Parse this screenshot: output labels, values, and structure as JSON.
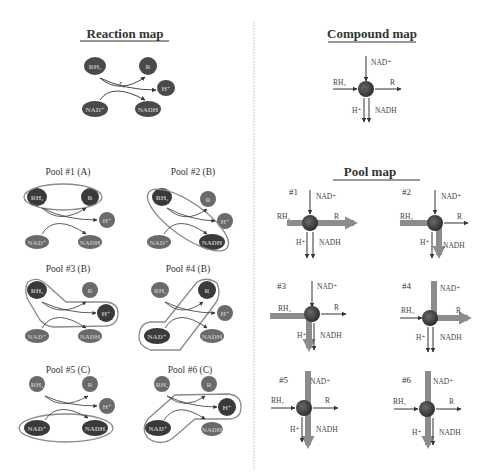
{
  "reaction_map": {
    "title": "Reaction map",
    "rate_label": "r₁",
    "nodes": {
      "rh2": "RH₂",
      "r": "R",
      "h": "H⁺",
      "nad": "NAD⁺",
      "nadh": "NADH"
    }
  },
  "compound_map": {
    "title": "Compound map",
    "center_label": "r₁",
    "labels": {
      "nad": "NAD⁺",
      "rh2": "RH₂",
      "r": "R",
      "h": "H⁺",
      "nadh": "NADH"
    }
  },
  "pools": [
    {
      "label": "Pool #1 (A)",
      "members": [
        "RH₂",
        "R"
      ]
    },
    {
      "label": "Pool #2 (B)",
      "members": [
        "RH₂",
        "NADH"
      ]
    },
    {
      "label": "Pool #3 (B)",
      "members": [
        "RH₂",
        "H⁺"
      ]
    },
    {
      "label": "Pool #4 (B)",
      "members": [
        "NAD⁺",
        "R"
      ]
    },
    {
      "label": "Pool #5 (C)",
      "members": [
        "NAD⁺",
        "NADH"
      ]
    },
    {
      "label": "Pool #6 (C)",
      "members": [
        "NAD⁺",
        "H⁺"
      ]
    }
  ],
  "pool_map": {
    "title": "Pool map",
    "panels": [
      {
        "num": "#1",
        "nad": "NAD⁺",
        "rh2": "RH₂",
        "r": "R",
        "h": "H⁺",
        "nadh": "NADH"
      },
      {
        "num": "#2",
        "nad": "NAD⁺",
        "rh2": "RH₂",
        "r": "R",
        "h": "H⁺",
        "nadh": "NADH"
      },
      {
        "num": "#3",
        "nad": "NAD⁺",
        "rh2": "RH₂",
        "r": "R",
        "h": "H⁺",
        "nadh": "NADH"
      },
      {
        "num": "#4",
        "nad": "NAD⁺",
        "rh2": "RH₂",
        "r": "R",
        "h": "H⁺",
        "nadh": "NADH"
      },
      {
        "num": "#5",
        "nad": "NAD⁺",
        "rh2": "RH₂",
        "r": "R",
        "h": "H⁺",
        "nadh": "NADH"
      },
      {
        "num": "#6",
        "nad": "NAD⁺",
        "rh2": "RH₂",
        "r": "R",
        "h": "H⁺",
        "nadh": "NADH"
      }
    ]
  },
  "colors": {
    "node_dark": "#3f3f3f",
    "node_light": "#6e6e6e",
    "pool_outline": "#8a8a8a",
    "thick_arrow": "#8c8c8c",
    "thin_arrow": "#333333",
    "divider": "#bbbbbb"
  }
}
